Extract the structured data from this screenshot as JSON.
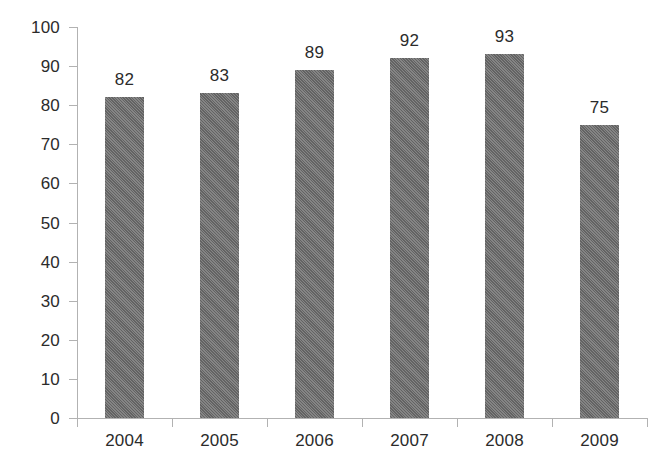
{
  "chart_data": {
    "type": "bar",
    "title": "",
    "subtitle": "",
    "xlabel": "",
    "ylabel": "",
    "categories": [
      "2004",
      "2005",
      "2006",
      "2007",
      "2008",
      "2009"
    ],
    "values": [
      82,
      83,
      89,
      92,
      93,
      75
    ],
    "value_labels": [
      "82",
      "83",
      "89",
      "92",
      "93",
      "75"
    ],
    "ylim": [
      0,
      100
    ],
    "ytick_values": [
      0,
      10,
      20,
      30,
      40,
      50,
      60,
      70,
      80,
      90,
      100
    ],
    "ytick_labels": [
      "0",
      "10",
      "20",
      "30",
      "40",
      "50",
      "60",
      "70",
      "80",
      "90",
      "100"
    ],
    "grid": false,
    "legend": false,
    "legend_position": "none",
    "bar_color": "#6e6e6e",
    "axis_color": "#b2b2b2",
    "text_color": "#2b2b2b",
    "background_color": "#ffffff"
  }
}
